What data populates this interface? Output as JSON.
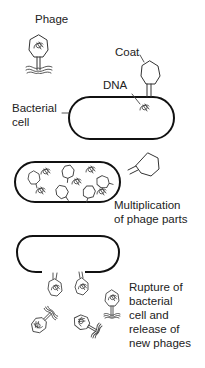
{
  "diagram": {
    "stages": [
      {
        "id": "attachment",
        "labels": {
          "phage": "Phage",
          "coat": "Coat",
          "dna": "DNA",
          "bacterial_cell_line1": "Bacterial",
          "bacterial_cell_line2": "cell"
        }
      },
      {
        "id": "multiplication",
        "caption_line1": "Multiplication",
        "caption_line2": "of phage parts"
      },
      {
        "id": "rupture",
        "caption_lines": [
          "Rupture of",
          "bacterial",
          "cell and",
          "release of",
          "new phages"
        ]
      }
    ],
    "colors": {
      "background": "#ffffff",
      "outline": "#111111",
      "sketch": "#444444",
      "text": "#222222"
    }
  }
}
